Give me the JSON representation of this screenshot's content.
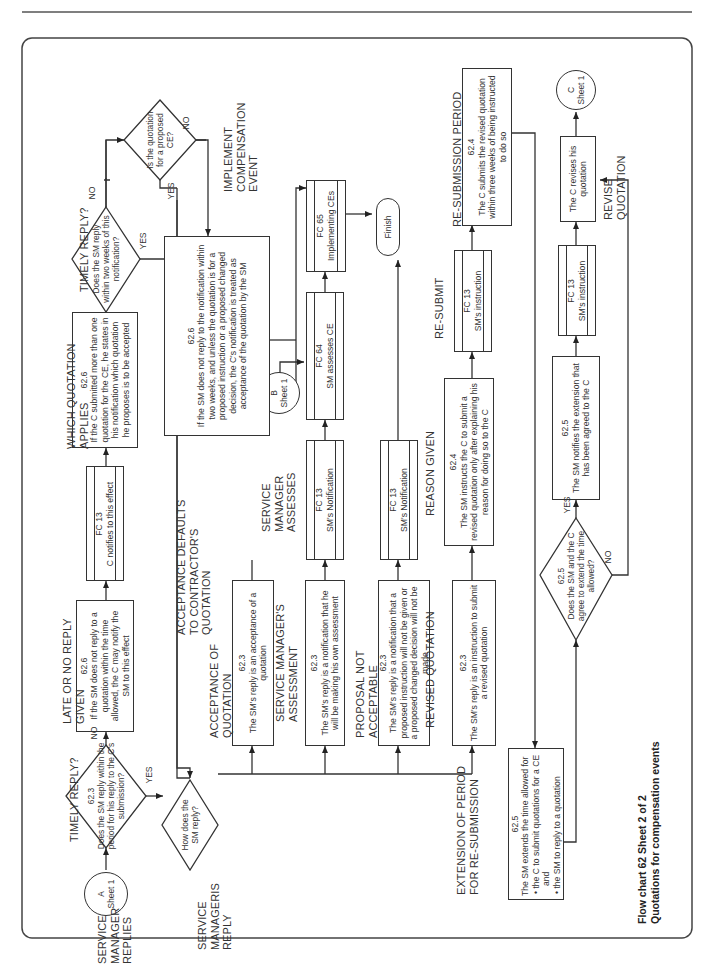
{
  "page": {
    "caption_line1": "Flow chart 62 Sheet 2 of 2",
    "caption_line2": "Quotations for compensation events"
  },
  "connectors": {
    "a": {
      "letter": "A",
      "sheet": "Sheet 1"
    },
    "b": {
      "letter": "B",
      "sheet": "Sheet 1"
    },
    "c": {
      "letter": "C",
      "sheet": "Sheet 1"
    }
  },
  "headings": {
    "sm_replies": "SERVICE MANAGER REPLIES",
    "timely_reply_1": "TIMELY REPLY?",
    "late_no_reply": "LATE OR NO REPLY GIVEN",
    "which_quotation": "WHICH QUOTATION APPLIES",
    "timely_reply_2": "TIMELY REPLY?",
    "sm_reply": "SERVICE MANAGERIS REPLY",
    "acceptance_defaults": "ACCEPTANCE DEFAULTS TO CONTRACTOR'S QUOTATION",
    "implement_ce": "IMPLEMENT COMPENSATION EVENT",
    "acceptance_of_quotation": "ACCEPTANCE OF QUOTATION",
    "sm_assesses": "SERVICE MANAGER ASSESSES",
    "sm_assessment": "SERVICE MANAGER'S ASSESSMENT",
    "proposal_not_acceptable": "PROPOSAL NOT ACCEPTABLE",
    "revised_quotation": "REVISED QUOTATION",
    "reason_given": "REASON GIVEN",
    "re_submit": "RE-SUBMIT",
    "re_submission_period": "RE-SUBMISSION PERIOD",
    "extension_period": "EXTENSION OF PERIOD FOR RE-SUBMISSION",
    "revise_quotation": "REVISE QUOTATION"
  },
  "decisions": {
    "d1": {
      "ref": "62.3",
      "text": "Does the SM reply within the period for his reply to the C's submission?",
      "yes": "YES",
      "no": "NO"
    },
    "d2": {
      "text": "How does the SM reply?"
    },
    "d3": {
      "text": "Does the SM reply within two weeks of this notification?",
      "yes": "YES",
      "no": "NO"
    },
    "d4": {
      "text": "Is the quotation for a proposed CE?",
      "yes": "YES",
      "no": "NO"
    },
    "d5": {
      "ref": "62.5",
      "text": "Does the SM and the C agree to extend the time allowed?",
      "yes": "YES",
      "no": "NO"
    }
  },
  "boxes": {
    "late_reply": {
      "ref": "62.6",
      "text": "If the SM does not reply to a quotation within the time allowed, the C may notify the SM to this effect"
    },
    "fc13_c_notifies": {
      "ref": "FC 13",
      "text": "C notifies to this effect"
    },
    "which_quotation": {
      "ref": "62.6",
      "text": "If the C submitted more than one quotation for the CE, he states in his notification which quotation he proposes is to be accepted"
    },
    "acceptance_default": {
      "ref": "62.6",
      "text": "If the SM does not reply to the notification within two weeks, and unless the quotation is for a proposed instruction or a proposed changed decision, the C's notification is treated as acceptance of the quotation by the SM"
    },
    "acceptance": {
      "ref": "62.3",
      "text": "The SM's reply is an acceptance of a quotation"
    },
    "assessment": {
      "ref": "62.3",
      "text": "The SM's reply is a notification that he will be making his own assessment"
    },
    "fc13_sm_notification_1": {
      "ref": "FC 13",
      "text": "SM's Notification"
    },
    "fc64": {
      "ref": "FC 64",
      "text": "SM assesses CE"
    },
    "fc65": {
      "ref": "FC 65",
      "text": "Implementing CEs"
    },
    "finish": {
      "text": "Finish"
    },
    "not_acceptable": {
      "ref": "62.3",
      "text": "The SM's reply is a notification that a proposed instruction will not be given or a proposed changed decision will not be made"
    },
    "fc13_sm_notification_2": {
      "ref": "FC 13",
      "text": "SM's Notification"
    },
    "revised": {
      "ref": "62.3",
      "text": "The SM's reply is an instruction to submit a revised quotation"
    },
    "reason": {
      "ref": "62.4",
      "text": "The SM instructs the C to submit a revised quotation only after explaining his reason for doing so to the C"
    },
    "fc13_instruction_1": {
      "ref": "FC 13",
      "text": "SM's instruction"
    },
    "resubmission": {
      "ref": "62.4",
      "text": "The C submits the revised quotation within three weeks of being instructed to do so"
    },
    "extension": {
      "ref": "62.5",
      "text": "The SM extends the time allowed for",
      "bullets": [
        "the C to submit quotations for a CE and",
        "the SM to reply to a quotation"
      ]
    },
    "notifies_extension": {
      "ref": "62.5",
      "text": "The SM notifies the extension that has been agreed to the C"
    },
    "fc13_instruction_2": {
      "ref": "FC 13",
      "text": "SM's instruction"
    },
    "c_revises": {
      "text": "The C revises his quotation"
    }
  }
}
